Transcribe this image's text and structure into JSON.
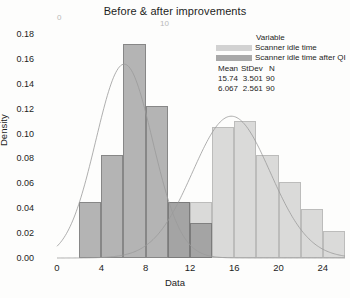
{
  "title": "Before & after improvements",
  "ghost_artifacts": {
    "left": "0",
    "right": "10"
  },
  "axes": {
    "x_title": "Data",
    "y_title": "Density",
    "x_ticks": [
      "0",
      "4",
      "8",
      "12",
      "16",
      "20",
      "24"
    ],
    "y_ticks": [
      "0.18",
      "0.16",
      "0.14",
      "0.12",
      "0.10",
      "0.08",
      "0.06",
      "0.04",
      "0.02",
      "0.00"
    ]
  },
  "legend": {
    "title": "Variable",
    "entries": [
      {
        "label": "Scanner idle time",
        "color": "#d2d2d2"
      },
      {
        "label": "Scanner idle time after QI",
        "color": "#a8a8a8"
      }
    ]
  },
  "stats": {
    "headers": [
      "Mean",
      "StDev",
      "N"
    ],
    "rows": [
      {
        "mean": "15.74",
        "stdev": "3.501",
        "n": "90"
      },
      {
        "mean": "6.067",
        "stdev": "2.561",
        "n": "90"
      }
    ]
  },
  "chart_data": {
    "type": "bar",
    "title": "Before & after improvements",
    "xlabel": "Data",
    "ylabel": "Density",
    "xlim": [
      0,
      26
    ],
    "ylim": [
      0,
      0.18
    ],
    "grid": false,
    "legend_position": "top-right",
    "bin_width": 2,
    "overlay": "alpha-blended overlapping histograms with fitted normal curves",
    "series": [
      {
        "name": "Scanner idle time after QI",
        "color": "#a8a8a8",
        "mean": 6.067,
        "stdev": 2.561,
        "n": 90,
        "bins": [
          {
            "x0": 2,
            "x1": 4,
            "density": 0.045
          },
          {
            "x0": 4,
            "x1": 6,
            "density": 0.083
          },
          {
            "x0": 6,
            "x1": 8,
            "density": 0.172
          },
          {
            "x0": 8,
            "x1": 10,
            "density": 0.122
          },
          {
            "x0": 10,
            "x1": 12,
            "density": 0.045
          },
          {
            "x0": 12,
            "x1": 14,
            "density": 0.028
          }
        ],
        "fit_curve": {
          "type": "normal",
          "mean": 6.067,
          "stdev": 2.561,
          "peak_density": 0.1557
        }
      },
      {
        "name": "Scanner idle time",
        "color": "#d2d2d2",
        "mean": 15.74,
        "stdev": 3.501,
        "n": 90,
        "bins": [
          {
            "x0": 10,
            "x1": 12,
            "density": 0.045
          },
          {
            "x0": 12,
            "x1": 14,
            "density": 0.045
          },
          {
            "x0": 14,
            "x1": 16,
            "density": 0.105
          },
          {
            "x0": 16,
            "x1": 18,
            "density": 0.11
          },
          {
            "x0": 18,
            "x1": 20,
            "density": 0.083
          },
          {
            "x0": 20,
            "x1": 22,
            "density": 0.061
          },
          {
            "x0": 22,
            "x1": 24,
            "density": 0.039
          },
          {
            "x0": 24,
            "x1": 26,
            "density": 0.022
          }
        ],
        "fit_curve": {
          "type": "normal",
          "mean": 15.74,
          "stdev": 3.501,
          "peak_density": 0.1139
        }
      }
    ]
  }
}
